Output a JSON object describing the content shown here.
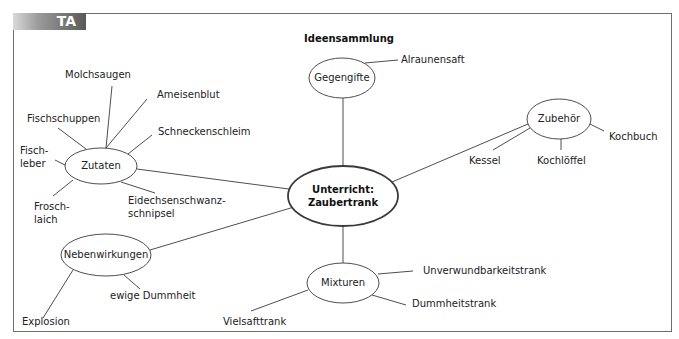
{
  "badge": {
    "label": "TA"
  },
  "title": "Ideensammlung",
  "center": {
    "line1": "Unterricht:",
    "line2": "Zaubertrank"
  },
  "nodes": {
    "gegengifte": {
      "label": "Gegengifte",
      "leaves": [
        "Alraunensaft"
      ]
    },
    "zutaten": {
      "label": "Zutaten",
      "leaves": [
        "Molchsaugen",
        "Ameisenblut",
        "Fischschuppen",
        "Schneckenschleim",
        "Fisch-",
        "leber",
        "Frosch-",
        "laich",
        "Eidechsenschwanz-",
        "schnipsel"
      ]
    },
    "zubehoer": {
      "label": "Zubehör",
      "leaves": [
        "Kochbuch",
        "Kessel",
        "Kochlöffel"
      ]
    },
    "nebenwirkungen": {
      "label": "Nebenwirkungen",
      "leaves": [
        "ewige Dummheit",
        "Explosion"
      ]
    },
    "mixturen": {
      "label": "Mixturen",
      "leaves": [
        "Unverwundbarkeitstrank",
        "Dummheitstrank",
        "Vielsafttrank"
      ]
    }
  },
  "colors": {
    "line": "#3a3a3a",
    "frame": "#6e6e6e",
    "badge_dark": "#5a5a5a"
  }
}
